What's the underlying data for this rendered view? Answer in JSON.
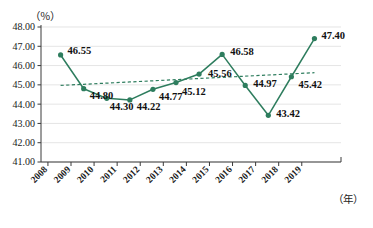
{
  "chart_data": {
    "type": "line",
    "title": "",
    "xlabel": "（年）",
    "ylabel": "（％）",
    "ylim": [
      41.0,
      48.0
    ],
    "ytick_labels": [
      "48.00",
      "47.00",
      "46.00",
      "45.00",
      "44.00",
      "43.00",
      "42.00",
      "41.00"
    ],
    "ytick_values": [
      48.0,
      47.0,
      46.0,
      45.0,
      44.0,
      43.0,
      42.0,
      41.0
    ],
    "grid": true,
    "legend_position": "none",
    "categories": [
      "2008",
      "2009",
      "2010",
      "2011",
      "2012",
      "2013",
      "2014",
      "2015",
      "2016",
      "2017",
      "2018",
      "2019"
    ],
    "series": [
      {
        "name": "数值",
        "style": "solid",
        "color": "#2E7D5E",
        "marker": "circle",
        "values": [
          46.55,
          44.8,
          44.3,
          44.22,
          44.77,
          45.12,
          45.56,
          46.58,
          44.97,
          43.42,
          45.42,
          47.4
        ]
      },
      {
        "name": "趋势线",
        "style": "dashed",
        "color": "#2E7D5E",
        "marker": "none",
        "values": [
          44.97,
          45.03,
          45.09,
          45.15,
          45.21,
          45.27,
          45.33,
          45.39,
          45.45,
          45.51,
          45.57,
          45.63
        ]
      }
    ],
    "data_labels": [
      "46.55",
      "44.80",
      "44.30",
      "44.22",
      "44.77",
      "45.12",
      "45.56",
      "46.58",
      "44.97",
      "43.42",
      "45.42",
      "47.40"
    ],
    "annotations": []
  },
  "axes": {
    "y_unit_label": "（％）",
    "x_unit_label": "（年）"
  },
  "colors": {
    "series": "#2E7D5E",
    "trend": "#2E7D5E",
    "grid": "#d8d8d8",
    "axis": "#3a3a3a",
    "text": "#111111",
    "background": "#ffffff"
  }
}
